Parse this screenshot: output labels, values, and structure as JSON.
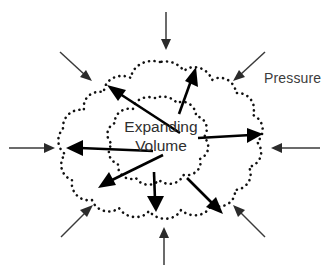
{
  "diagram": {
    "background_color": "#ffffff",
    "width": 326,
    "height": 276,
    "labels": {
      "pressure": "Pressure",
      "volume_line1": "Expanding",
      "volume_line2": "Volume"
    },
    "colors": {
      "outline": "#111111",
      "expansion_arrow": "#000000",
      "pressure_arrow": "#2b2b2b",
      "text": "#3c3c3c"
    },
    "contours": [
      {
        "name": "outer-volume-contour",
        "style": "dotted",
        "bounds": [
          62,
          60,
          262,
          222
        ]
      },
      {
        "name": "inner-volume-contour",
        "style": "dotted",
        "bounds": [
          108,
          97,
          205,
          185
        ]
      }
    ],
    "expansion_arrows": [
      {
        "name": "expansion-arrow-up-left",
        "direction": "up-left",
        "from": [
          180,
          133
        ],
        "to": [
          108,
          86
        ]
      },
      {
        "name": "expansion-arrow-up",
        "direction": "up",
        "from": [
          178,
          113
        ],
        "to": [
          196,
          67
        ]
      },
      {
        "name": "expansion-arrow-right",
        "direction": "right",
        "from": [
          200,
          138
        ],
        "to": [
          262,
          133
        ]
      },
      {
        "name": "expansion-arrow-left",
        "direction": "left",
        "from": [
          152,
          150
        ],
        "to": [
          66,
          148
        ]
      },
      {
        "name": "expansion-arrow-down-left",
        "direction": "down-left",
        "from": [
          163,
          155
        ],
        "to": [
          98,
          188
        ]
      },
      {
        "name": "expansion-arrow-down",
        "direction": "down",
        "from": [
          155,
          172
        ],
        "to": [
          155,
          210
        ]
      },
      {
        "name": "expansion-arrow-down-right",
        "direction": "down-right",
        "from": [
          188,
          178
        ],
        "to": [
          222,
          213
        ]
      }
    ],
    "pressure_arrows": [
      {
        "name": "pressure-arrow-north",
        "direction": "down",
        "from": [
          166,
          12
        ],
        "to": [
          166,
          48
        ]
      },
      {
        "name": "pressure-arrow-northeast",
        "direction": "down-left",
        "from": [
          264,
          52
        ],
        "to": [
          234,
          80
        ]
      },
      {
        "name": "pressure-arrow-east",
        "direction": "left",
        "from": [
          320,
          148
        ],
        "to": [
          272,
          148
        ]
      },
      {
        "name": "pressure-arrow-southeast",
        "direction": "up-left",
        "from": [
          264,
          236
        ],
        "to": [
          234,
          206
        ]
      },
      {
        "name": "pressure-arrow-south",
        "direction": "up",
        "from": [
          164,
          264
        ],
        "to": [
          164,
          228
        ]
      },
      {
        "name": "pressure-arrow-southwest",
        "direction": "up-right",
        "from": [
          62,
          236
        ],
        "to": [
          90,
          206
        ]
      },
      {
        "name": "pressure-arrow-west",
        "direction": "right",
        "from": [
          10,
          148
        ],
        "to": [
          52,
          148
        ]
      },
      {
        "name": "pressure-arrow-northwest",
        "direction": "down-right",
        "from": [
          60,
          52
        ],
        "to": [
          88,
          80
        ]
      }
    ]
  }
}
